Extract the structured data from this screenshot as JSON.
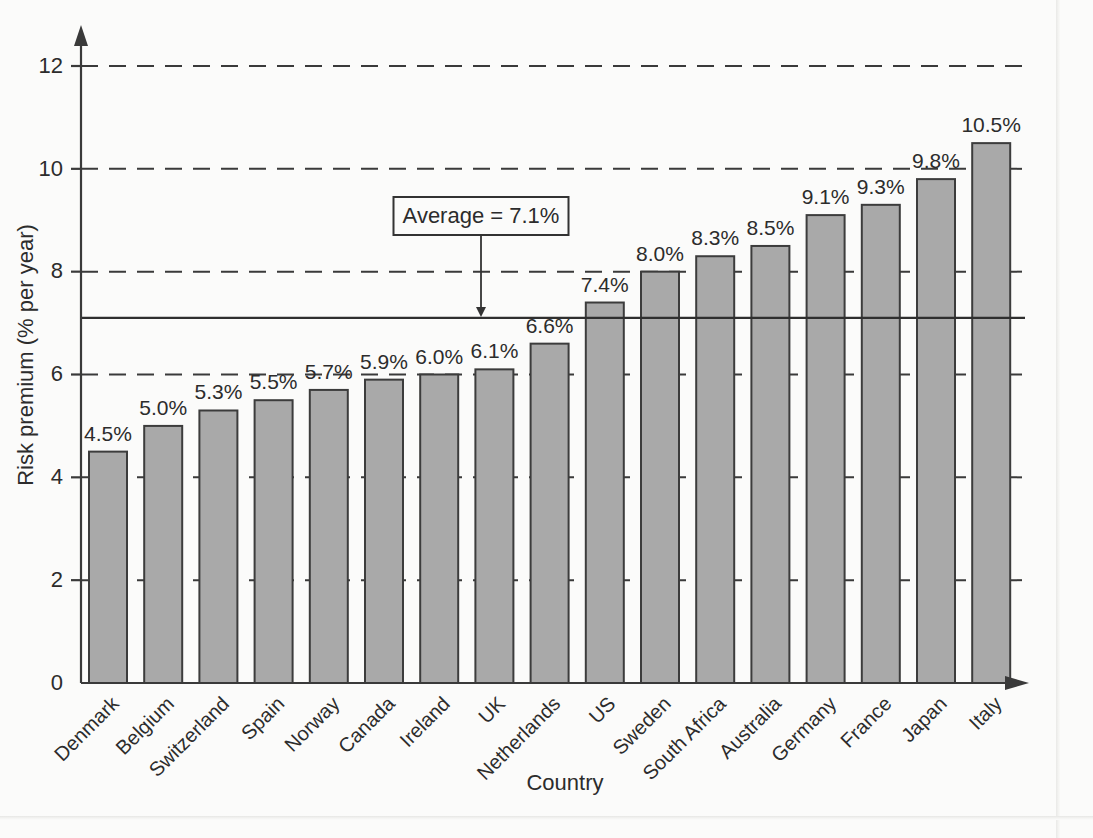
{
  "chart_data": {
    "type": "bar",
    "title": "",
    "xlabel": "Country",
    "ylabel": "Risk premium (% per year)",
    "categories": [
      "Denmark",
      "Belgium",
      "Switzerland",
      "Spain",
      "Norway",
      "Canada",
      "Ireland",
      "UK",
      "Netherlands",
      "US",
      "Sweden",
      "South Africa",
      "Australia",
      "Germany",
      "France",
      "Japan",
      "Italy"
    ],
    "values": [
      4.5,
      5.0,
      5.3,
      5.5,
      5.7,
      5.9,
      6.0,
      6.1,
      6.6,
      7.4,
      8.0,
      8.3,
      8.5,
      9.1,
      9.3,
      9.8,
      10.5
    ],
    "value_labels": [
      "4.5%",
      "5.0%",
      "5.3%",
      "5.5%",
      "5.7%",
      "5.9%",
      "6.0%",
      "6.1%",
      "6.6%",
      "7.4%",
      "8.0%",
      "8.3%",
      "8.5%",
      "9.1%",
      "9.3%",
      "9.8%",
      "10.5%"
    ],
    "ylim": [
      0,
      12
    ],
    "y_ticks": [
      0,
      2,
      4,
      6,
      8,
      10,
      12
    ],
    "y_tick_labels": [
      "0",
      "2",
      "4",
      "6",
      "8",
      "10",
      "12"
    ],
    "grid": "horizontal-dashed",
    "legend": "none",
    "annotations": [
      {
        "name": "average-callout",
        "text": "Average = 7.1%",
        "value": 7.1,
        "style": "boxed-label-with-arrow-to-line"
      }
    ],
    "reference_line": {
      "label": "Average",
      "value": 7.1,
      "value_text": "7.1%",
      "style": "solid"
    },
    "colors": {
      "bar_fill": "#a9a9a9",
      "bar_stroke": "#3c3c3c",
      "axis": "#3a3a3a",
      "grid": "#3a3a3a",
      "text": "#2c2c2c",
      "background": "#fbfbfa"
    }
  }
}
